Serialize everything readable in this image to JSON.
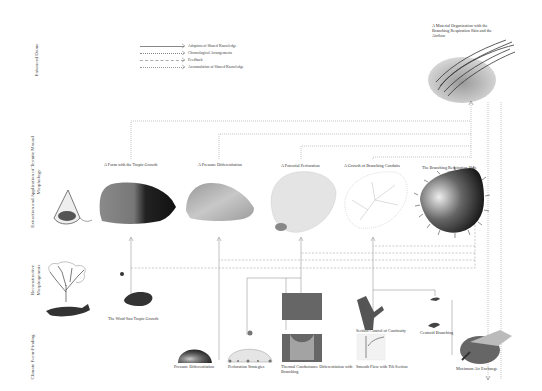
{
  "rows": [
    {
      "id": "enhanced",
      "label": "Enhanced Dome"
    },
    {
      "id": "extraction",
      "label": "Extraction and Application of Termite Mound Morphology"
    },
    {
      "id": "reconstructive",
      "label": "Reconstructive Morphogenesis"
    },
    {
      "id": "climate",
      "label": "Climate Form-Finding"
    }
  ],
  "legend": [
    {
      "label": "Adoption of Shared Knowledge",
      "style": "solid-dotted"
    },
    {
      "label": "Chronological Arrangements",
      "style": "dotted"
    },
    {
      "label": "Feedback",
      "style": "dashed"
    },
    {
      "label": "Accumulation of Shared Knowledge",
      "style": "dotted-arrow"
    }
  ],
  "top_result": {
    "caption": "A Material Organization with the Branching Respiration Skin and the Airflow"
  },
  "extraction_stages": [
    {
      "caption": "A Form with the Tropic Growth"
    },
    {
      "caption": "A Pressure Differentiation"
    },
    {
      "caption": "A Potential Perforation"
    },
    {
      "caption": "A Growth of Branching Conduits"
    },
    {
      "caption": "The Branching Respiration Skin"
    }
  ],
  "reconstructive": {
    "caption": "The Wind-Sun Tropic Growth"
  },
  "climate_items": [
    {
      "caption": "Pressure Differentiation"
    },
    {
      "caption": "Perforation Strategies"
    },
    {
      "caption": "Thermal Conductance Differentiation with Branching"
    },
    {
      "caption": "Section Control of Continuity"
    },
    {
      "caption": "Smooth Flow with Tilt Section"
    },
    {
      "caption": "Centroid Branching"
    },
    {
      "caption": "Maximum Air Exchange"
    }
  ],
  "colors": {
    "line": "#777777",
    "text": "#333333",
    "dark": "#2a2a2a",
    "mid": "#8a8a8a",
    "light": "#d0d0d0"
  }
}
